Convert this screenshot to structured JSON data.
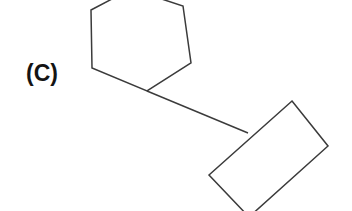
{
  "figure": {
    "panel_label": "(C)",
    "background_color": "#ffffff",
    "stroke_color": "#3b3b3b",
    "label_color": "#141414",
    "canvas": {
      "width": 352,
      "height": 211
    }
  },
  "chart_data": {
    "type": "diagram",
    "title": "(C)",
    "shapes": [
      {
        "name": "hexagon",
        "kind": "polygon",
        "sides": 6,
        "closed": true,
        "clipped_by_frame": "top",
        "stroke": "#3b3b3b",
        "fill": "none",
        "points": [
          [
            91,
            10
          ],
          [
            131,
            -11
          ],
          [
            183,
            6
          ],
          [
            191,
            63
          ],
          [
            147,
            91
          ],
          [
            92,
            68
          ]
        ]
      },
      {
        "name": "rectangle",
        "kind": "polygon",
        "sides": 4,
        "closed": true,
        "rotation_deg": 51,
        "clipped_by_frame": "bottom",
        "stroke": "#3b3b3b",
        "fill": "none",
        "points": [
          [
            292,
            101
          ],
          [
            328,
            146
          ],
          [
            249,
            217
          ],
          [
            209,
            175
          ]
        ]
      },
      {
        "name": "connector",
        "kind": "line",
        "stroke": "#3b3b3b",
        "from": [
          147,
          91
        ],
        "to": [
          248,
          133
        ],
        "connects": [
          "hexagon",
          "rectangle"
        ]
      }
    ],
    "xlim": [
      0,
      352
    ],
    "ylim": [
      0,
      211
    ],
    "grid": false,
    "axes_visible": false,
    "legend": null
  },
  "label_position": {
    "x": 26,
    "y": 60
  }
}
